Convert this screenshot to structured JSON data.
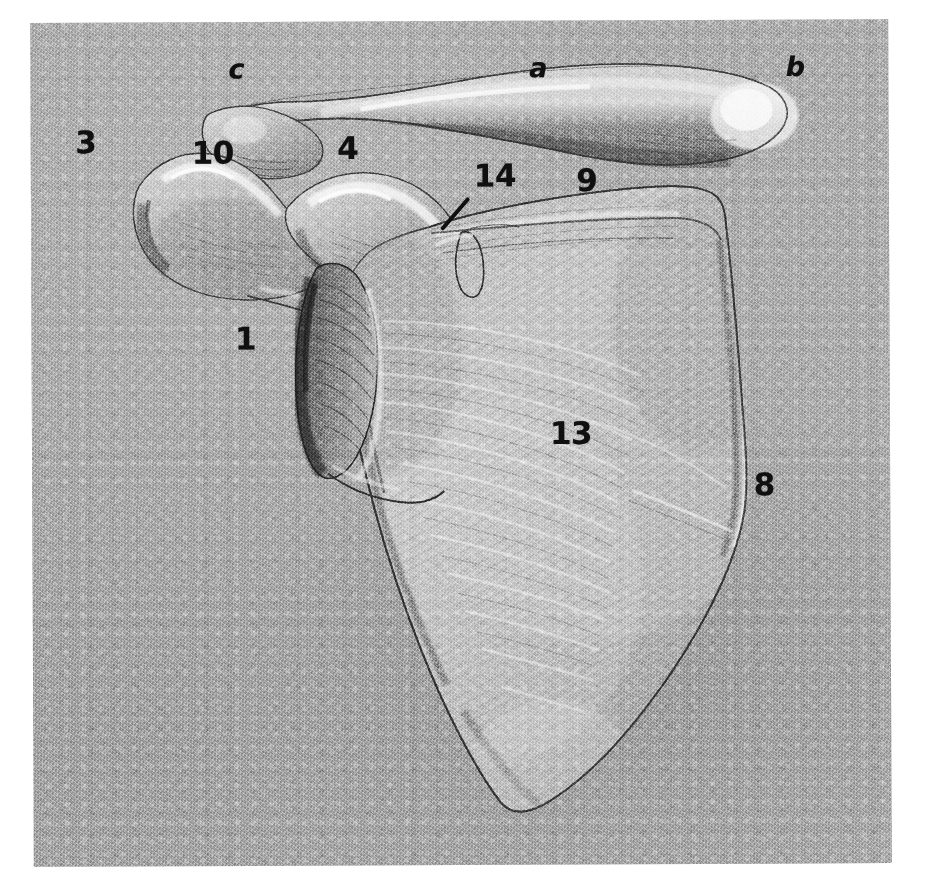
{
  "figure": {
    "medium": "pencil-drawing",
    "paper_color": "#a9a9a9",
    "ink_color": "#101010",
    "sheet": {
      "left": 32,
      "top": 21,
      "width": 858,
      "height": 844
    }
  },
  "labels": [
    {
      "id": "label-c",
      "text": "c",
      "kind": "letter",
      "x": 238,
      "y": 68,
      "leader": null
    },
    {
      "id": "label-a",
      "text": "a",
      "kind": "letter",
      "x": 540,
      "y": 68,
      "leader": null
    },
    {
      "id": "label-b",
      "text": "b",
      "kind": "letter",
      "x": 797,
      "y": 68,
      "leader": null
    },
    {
      "id": "label-3",
      "text": "3",
      "kind": "number",
      "x": 87,
      "y": 141,
      "leader": null
    },
    {
      "id": "label-10",
      "text": "10",
      "kind": "number",
      "x": 214,
      "y": 152,
      "leader": null
    },
    {
      "id": "label-4",
      "text": "4",
      "kind": "number",
      "x": 349,
      "y": 148,
      "leader": null
    },
    {
      "id": "label-14",
      "text": "14",
      "kind": "number",
      "x": 496,
      "y": 176,
      "leader": {
        "x": 470,
        "y": 196,
        "length": 42,
        "angle": 131,
        "thickness": 4
      }
    },
    {
      "id": "label-9",
      "text": "9",
      "kind": "number",
      "x": 588,
      "y": 181,
      "leader": null
    },
    {
      "id": "label-1",
      "text": "1",
      "kind": "number",
      "x": 246,
      "y": 338,
      "leader": null
    },
    {
      "id": "label-13",
      "text": "13",
      "kind": "number",
      "x": 571,
      "y": 434,
      "leader": null
    },
    {
      "id": "label-8",
      "text": "8",
      "kind": "number",
      "x": 764,
      "y": 486,
      "leader": null
    }
  ]
}
